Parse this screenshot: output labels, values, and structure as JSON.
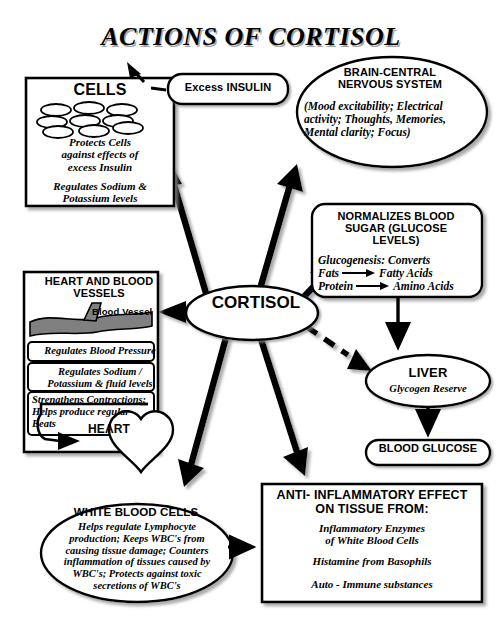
{
  "title": "ACTIONS OF CORTISOL",
  "colors": {
    "stroke": "#000000",
    "fill": "#ffffff",
    "vessel": "#808080",
    "shadow": "#9a9a9a"
  },
  "center": {
    "label": "CORTISOL"
  },
  "nodes": {
    "cells": {
      "title": "CELLS",
      "body1": "Protects Cells\nagainst effects of\nexcess Insulin",
      "body2": "Regulates Sodium &\nPotassium levels"
    },
    "insulin": {
      "label": "Excess INSULIN"
    },
    "brain": {
      "title": "BRAIN-CENTRAL\nNERVOUS SYSTEM",
      "body": "(Mood excitability; Electrical activity; Thoughts, Memories, Mental clarity; Focus)"
    },
    "blood_sugar": {
      "title": "NORMALIZES BLOOD SUGAR (GLUCOSE LEVELS)",
      "line1": "Glucogenesis: Converts",
      "reaction1_left": "Fats",
      "reaction1_right": "Fatty Acids",
      "reaction2_left": "Protein",
      "reaction2_right": "Amino Acids"
    },
    "liver": {
      "title": "LIVER",
      "body": "Glycogen Reserve"
    },
    "blood_glucose": {
      "label": "BLOOD GLUCOSE"
    },
    "heart_vessels": {
      "title": "HEART AND BLOOD VESSELS",
      "vessel_label": "Blood Vessel",
      "row1": "Regulates Blood Pressure",
      "row2": "Regulates Sodium /\nPotassium & fluid levels",
      "row3": "Strengthens Contractions;\nHelps produce regular\nBeats",
      "heart_label": "HEART"
    },
    "white_blood_cells": {
      "title": "WHITE BLOOD CELLS",
      "body": "Helps regulate Lymphocyte\nproduction; Keeps WBC's from\ncausing tissue damage; Counters\ninflammation of tissues caused by\nWBC's;  Protects against toxic\nsecretions of WBC's"
    },
    "anti_inflammatory": {
      "title": "ANTI- INFLAMMATORY EFFECT ON TISSUE FROM:",
      "item1": "Inflammatory Enzymes\nof White Blood Cells",
      "item2": "Histamine from Basophils",
      "item3": "Auto - Immune substances"
    }
  },
  "connections": [
    {
      "name": "cortisol-to-cells",
      "style": "solid-thick"
    },
    {
      "name": "cortisol-to-brain",
      "style": "solid-thick"
    },
    {
      "name": "cortisol-to-blood-sugar",
      "style": "solid-thick"
    },
    {
      "name": "cortisol-to-heart-vessels",
      "style": "solid-thick"
    },
    {
      "name": "cortisol-to-white-blood-cells",
      "style": "solid-thick"
    },
    {
      "name": "cortisol-to-anti-inflammatory",
      "style": "solid-thick"
    },
    {
      "name": "cortisol-to-liver",
      "style": "dashed-thick"
    },
    {
      "name": "insulin-to-cells",
      "style": "dashed-thin"
    },
    {
      "name": "blood-sugar-to-liver",
      "style": "solid-thin"
    },
    {
      "name": "liver-to-blood-glucose",
      "style": "solid-thin"
    },
    {
      "name": "white-blood-cells-to-anti-inflammatory",
      "style": "solid-thin"
    },
    {
      "name": "heart-feedback-loop",
      "style": "solid-thin"
    }
  ]
}
